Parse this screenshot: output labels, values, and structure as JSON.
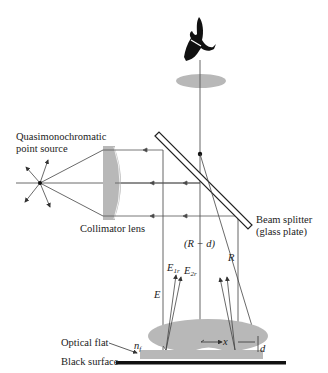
{
  "labels": {
    "source": [
      "Quasimonochromatic",
      "point source"
    ],
    "collimator": "Collimator lens",
    "beam_splitter": [
      "Beam  splitter",
      "(glass plate)"
    ],
    "r_minus_d": "(R − d)",
    "R": "R",
    "E": "E",
    "E1r": "E",
    "E1r_sub": "1r",
    "E2r": "E",
    "E2r_sub": "2r",
    "x": "x",
    "d": "d",
    "optical_flat": "Optical flat",
    "nf": "n",
    "nf_sub": "f",
    "black_surface": "Black surface"
  },
  "colors": {
    "line": "#555555",
    "lens_fill": "#b8b8b8",
    "black": "#111111"
  }
}
